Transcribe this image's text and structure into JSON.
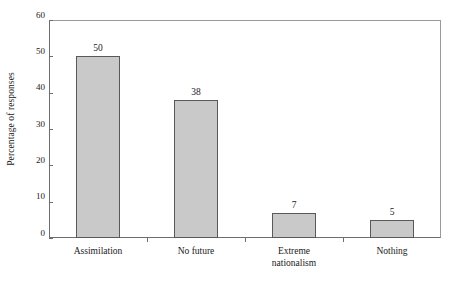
{
  "chart_data": {
    "type": "bar",
    "title": "",
    "subtitle": "",
    "xlabel": "",
    "ylabel": "Percentage of responses",
    "categories": [
      "Assimilation",
      "No future",
      "Extreme nationalism",
      "Nothing"
    ],
    "values": [
      50,
      38,
      7,
      5
    ],
    "value_labels": [
      "50",
      "38",
      "7",
      "5"
    ],
    "ylim": [
      0,
      60
    ],
    "ytick_labels": [
      "0",
      "10",
      "20",
      "30",
      "40",
      "50",
      "60"
    ],
    "ytick_values": [
      0,
      10,
      20,
      30,
      40,
      50,
      60
    ],
    "grid": false,
    "legend": "none",
    "colors": {
      "bar_fill": "#c9c9c9",
      "bar_border": "#595959",
      "axis": "#6e6e6e",
      "frame": "#9a9a9a",
      "text": "#1a1a1a",
      "background": "#ffffff"
    }
  },
  "category_label_lines": [
    [
      "Assimilation"
    ],
    [
      "No future"
    ],
    [
      "Extreme",
      "nationalism"
    ],
    [
      "Nothing"
    ]
  ]
}
